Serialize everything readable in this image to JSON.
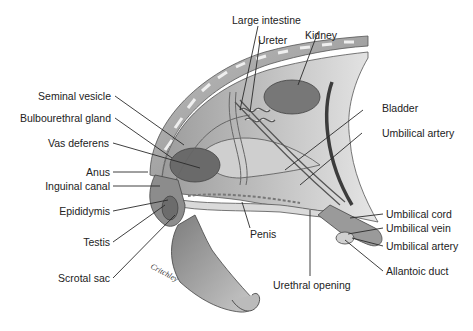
{
  "figure": {
    "type": "anatomical-illustration",
    "signature": "Critchley",
    "colors": {
      "background": "#ffffff",
      "label_text": "#222222",
      "leader_line": "#2a2a2a",
      "tissue_dark": "#6e6e6e",
      "tissue_mid": "#9a9a9a",
      "tissue_light": "#d6d6d6"
    }
  },
  "labels": {
    "left": [
      {
        "id": "seminal-vesicle",
        "text": "Seminal vesicle"
      },
      {
        "id": "bulbourethral-gland",
        "text": "Bulbourethral gland"
      },
      {
        "id": "vas-deferens",
        "text": "Vas deferens"
      },
      {
        "id": "anus",
        "text": "Anus"
      },
      {
        "id": "inguinal-canal",
        "text": "Inguinal canal"
      },
      {
        "id": "epididymis",
        "text": "Epididymis"
      },
      {
        "id": "testis",
        "text": "Testis"
      },
      {
        "id": "scrotal-sac",
        "text": "Scrotal sac"
      }
    ],
    "top": [
      {
        "id": "large-intestine",
        "text": "Large intestine"
      },
      {
        "id": "ureter",
        "text": "Ureter"
      },
      {
        "id": "kidney",
        "text": "Kidney"
      }
    ],
    "right": [
      {
        "id": "bladder",
        "text": "Bladder"
      },
      {
        "id": "umbilical-artery-upper",
        "text": "Umbilical artery"
      },
      {
        "id": "umbilical-cord",
        "text": "Umbilical cord"
      },
      {
        "id": "umbilical-vein",
        "text": "Umbilical vein"
      },
      {
        "id": "umbilical-artery-lower",
        "text": "Umbilical artery"
      },
      {
        "id": "allantoic-duct",
        "text": "Allantoic duct"
      }
    ],
    "bottom": [
      {
        "id": "penis",
        "text": "Penis"
      },
      {
        "id": "urethral-opening",
        "text": "Urethral opening"
      }
    ]
  }
}
